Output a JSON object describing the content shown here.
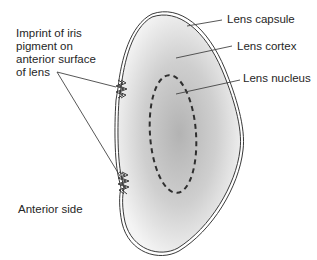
{
  "diagram": {
    "labels": {
      "lens_capsule": "Lens capsule",
      "lens_cortex": "Lens cortex",
      "lens_nucleus": "Lens nucleus",
      "iris_imprint_line1": "Imprint of iris",
      "iris_imprint_line2": "pigment on",
      "iris_imprint_line3": "anterior surface",
      "iris_imprint_line4": "of lens",
      "anterior_side": "Anterior side"
    },
    "colors": {
      "outline": "#3a3a3a",
      "cortex_fill_outer": "#f2f2f2",
      "cortex_fill_inner": "#b5b5b5",
      "nucleus_dash": "#2f2f2f",
      "leader_line": "#444444",
      "text": "#262626"
    }
  }
}
